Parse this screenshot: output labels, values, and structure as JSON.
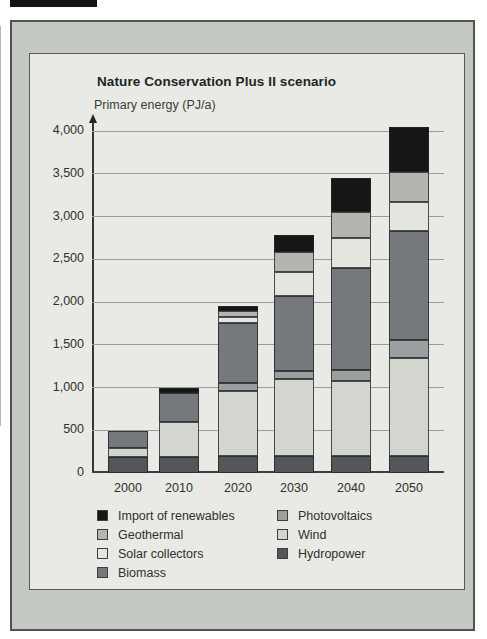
{
  "figure": {
    "title": "Nature Conservation Plus II scenario",
    "axis_label": "Primary energy (PJ/a)"
  },
  "chart_data": {
    "type": "bar",
    "stacked": true,
    "title": "Nature Conservation Plus II scenario",
    "ylabel": "Primary energy (PJ/a)",
    "xlabel": "",
    "categories": [
      "2000",
      "2010",
      "2020",
      "2030",
      "2040",
      "2050"
    ],
    "ylim": [
      0,
      4000
    ],
    "ytick_interval": 500,
    "ytick_labels": [
      "0",
      "500",
      "1,000",
      "1,500",
      "2,000",
      "2,500",
      "3,000",
      "3,500",
      "4,000"
    ],
    "grid": true,
    "series": [
      {
        "name": "Hydropower",
        "color": "#53575a",
        "values": [
          190,
          190,
          200,
          200,
          200,
          200
        ]
      },
      {
        "name": "Wind",
        "color": "#d3d5cf",
        "values": [
          100,
          410,
          760,
          900,
          880,
          1150
        ]
      },
      {
        "name": "Photovoltaics",
        "color": "#9b9f9f",
        "values": [
          0,
          0,
          90,
          90,
          120,
          200
        ]
      },
      {
        "name": "Biomass",
        "color": "#75797b",
        "values": [
          200,
          340,
          700,
          880,
          1200,
          1280
        ]
      },
      {
        "name": "Solar collectors",
        "color": "#e4e5df",
        "values": [
          0,
          0,
          80,
          280,
          350,
          340
        ]
      },
      {
        "name": "Geothermal",
        "color": "#b3b5b1",
        "values": [
          0,
          0,
          70,
          230,
          300,
          350
        ]
      },
      {
        "name": "Import of renewables",
        "color": "#161616",
        "values": [
          0,
          50,
          50,
          200,
          400,
          530
        ]
      }
    ],
    "legend": {
      "position": "bottom",
      "columns": [
        [
          {
            "label": "Import of renewables",
            "color": "#161616"
          },
          {
            "label": "Geothermal",
            "color": "#b3b5b1"
          },
          {
            "label": "Solar collectors",
            "color": "#e4e5df"
          },
          {
            "label": "Biomass",
            "color": "#75797b"
          }
        ],
        [
          {
            "label": "Photovoltaics",
            "color": "#9b9f9f"
          },
          {
            "label": "Wind",
            "color": "#d3d5cf"
          },
          {
            "label": "Hydropower",
            "color": "#53575a"
          }
        ]
      ]
    }
  },
  "colors": {
    "frame": "#c4c8c3",
    "panel": "#e9eae5",
    "gridline": "#989e98",
    "text": "#2e302e"
  }
}
